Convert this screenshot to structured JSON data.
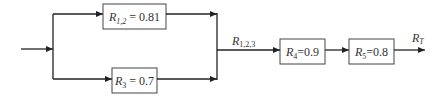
{
  "diagram": {
    "type": "reliability-block-diagram",
    "colors": {
      "line": "#222222",
      "box_border": "#444444",
      "text": "#333333",
      "background": "#ffffff"
    },
    "blocks": [
      {
        "id": "r12",
        "symbol": "R",
        "subscript": "1,2",
        "sep": " = ",
        "value": "0.81"
      },
      {
        "id": "r3",
        "symbol": "R",
        "subscript": "3",
        "sep": " = ",
        "value": "0.7"
      },
      {
        "id": "r4",
        "symbol": "R",
        "subscript": "4",
        "sep": "=",
        "value": "0.9"
      },
      {
        "id": "r5",
        "symbol": "R",
        "subscript": "5",
        "sep": "=",
        "value": "0.8"
      }
    ],
    "labels": {
      "r123": {
        "symbol": "R",
        "subscript": "1,2,3"
      },
      "rt": {
        "symbol": "R",
        "subscript": "T"
      }
    },
    "structure": "(R1,2 parallel R3) series R4 series R5"
  }
}
